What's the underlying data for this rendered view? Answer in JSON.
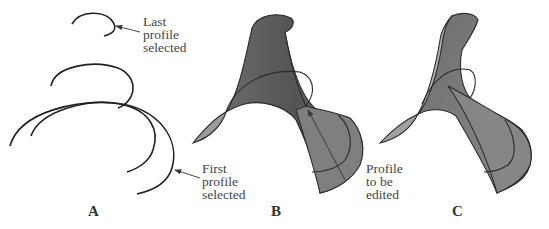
{
  "figure": {
    "panels": [
      {
        "id": "A",
        "label": "A",
        "description": "Wireframe profile curves"
      },
      {
        "id": "B",
        "label": "B",
        "description": "Lofted surface through profiles"
      },
      {
        "id": "C",
        "label": "C",
        "description": "Surface after editing profile"
      }
    ],
    "callouts": {
      "last_profile": "Last\nprofile\nselected",
      "first_profile": "First\nprofile\nselected",
      "profile_to_edit": "Profile\nto be\nedited"
    },
    "colors": {
      "surface_dark": "#5e5e5e",
      "surface_mid": "#7a7a7a",
      "surface_light": "#a8a8a8",
      "edge": "#2a2a2a",
      "text": "#444444"
    }
  }
}
